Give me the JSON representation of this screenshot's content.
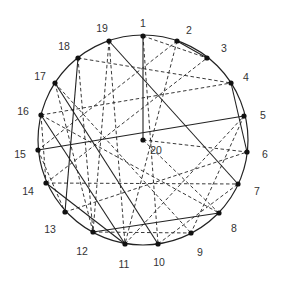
{
  "diagram": {
    "title": "",
    "circle": {
      "cx": 143,
      "cy": 140,
      "r": 105
    },
    "nodes": [
      {
        "id": "1",
        "x": 143,
        "y": 36,
        "lx": 143,
        "ly": 24
      },
      {
        "id": "2",
        "x": 177,
        "y": 41,
        "lx": 189,
        "ly": 31
      },
      {
        "id": "3",
        "x": 207,
        "y": 58,
        "lx": 224,
        "ly": 49
      },
      {
        "id": "4",
        "x": 231,
        "y": 83,
        "lx": 246,
        "ly": 78
      },
      {
        "id": "5",
        "x": 244,
        "y": 116,
        "lx": 263,
        "ly": 116
      },
      {
        "id": "6",
        "x": 247,
        "y": 152,
        "lx": 265,
        "ly": 155
      },
      {
        "id": "7",
        "x": 238,
        "y": 184,
        "lx": 257,
        "ly": 192
      },
      {
        "id": "8",
        "x": 219,
        "y": 213,
        "lx": 234,
        "ly": 229
      },
      {
        "id": "9",
        "x": 191,
        "y": 233,
        "lx": 200,
        "ly": 253
      },
      {
        "id": "10",
        "x": 158,
        "y": 244,
        "lx": 159,
        "ly": 263
      },
      {
        "id": "11",
        "x": 125,
        "y": 244,
        "lx": 124,
        "ly": 265
      },
      {
        "id": "12",
        "x": 93,
        "y": 232,
        "lx": 82,
        "ly": 252
      },
      {
        "id": "13",
        "x": 65,
        "y": 212,
        "lx": 50,
        "ly": 230
      },
      {
        "id": "14",
        "x": 46,
        "y": 183,
        "lx": 28,
        "ly": 192
      },
      {
        "id": "15",
        "x": 38,
        "y": 150,
        "lx": 20,
        "ly": 155
      },
      {
        "id": "16",
        "x": 41,
        "y": 115,
        "lx": 23,
        "ly": 112
      },
      {
        "id": "17",
        "x": 55,
        "y": 83,
        "lx": 40,
        "ly": 77
      },
      {
        "id": "18",
        "x": 78,
        "y": 58,
        "lx": 64,
        "ly": 47
      },
      {
        "id": "19",
        "x": 109,
        "y": 41,
        "lx": 102,
        "ly": 29
      },
      {
        "id": "20",
        "x": 143,
        "y": 140,
        "lx": 156,
        "ly": 151
      }
    ],
    "solid_edges": [
      [
        "1",
        "20"
      ],
      [
        "19",
        "7"
      ],
      [
        "17",
        "10"
      ],
      [
        "16",
        "11"
      ],
      [
        "14",
        "11"
      ],
      [
        "18",
        "13"
      ],
      [
        "15",
        "5"
      ],
      [
        "12",
        "8"
      ],
      [
        "4",
        "6"
      ],
      [
        "2",
        "3"
      ]
    ],
    "dashed_edges": [
      [
        "1",
        "3"
      ],
      [
        "1",
        "10"
      ],
      [
        "2",
        "11"
      ],
      [
        "19",
        "11"
      ],
      [
        "19",
        "12"
      ],
      [
        "18",
        "4"
      ],
      [
        "18",
        "12"
      ],
      [
        "17",
        "12"
      ],
      [
        "17",
        "9"
      ],
      [
        "16",
        "4"
      ],
      [
        "16",
        "8"
      ],
      [
        "15",
        "13"
      ],
      [
        "14",
        "7"
      ],
      [
        "14",
        "3"
      ],
      [
        "13",
        "6"
      ],
      [
        "12",
        "9"
      ],
      [
        "11",
        "5"
      ],
      [
        "10",
        "7"
      ],
      [
        "20",
        "6"
      ],
      [
        "20",
        "8"
      ],
      [
        "16",
        "14"
      ],
      [
        "5",
        "9"
      ],
      [
        "2",
        "15"
      ]
    ]
  }
}
